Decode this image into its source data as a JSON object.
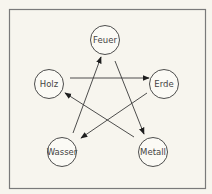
{
  "diagram": {
    "title": "",
    "colors": {
      "background": "#f7f5ee",
      "frame": "#7a7a7a",
      "stroke": "#3a3a3a",
      "node_fill": "#fbfaf5",
      "text": "#444444"
    },
    "nodes": [
      {
        "id": "feuer",
        "label": "Feuer",
        "x": 105,
        "y": 40
      },
      {
        "id": "erde",
        "label": "Erde",
        "x": 164,
        "y": 84
      },
      {
        "id": "metall",
        "label": "Metall",
        "x": 153,
        "y": 152
      },
      {
        "id": "wasser",
        "label": "Wasser",
        "x": 62,
        "y": 152
      },
      {
        "id": "holz",
        "label": "Holz",
        "x": 49,
        "y": 84
      }
    ],
    "edges": [
      {
        "from": "Holz",
        "to": "Erde"
      },
      {
        "from": "Erde",
        "to": "Wasser"
      },
      {
        "from": "Wasser",
        "to": "Feuer"
      },
      {
        "from": "Feuer",
        "to": "Metall"
      },
      {
        "from": "Metall",
        "to": "Holz"
      }
    ]
  }
}
